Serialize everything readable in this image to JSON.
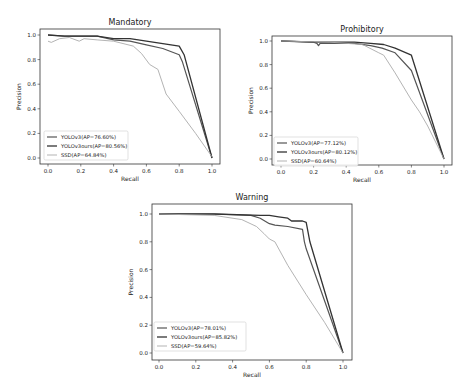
{
  "chart_data": [
    {
      "type": "line",
      "title": "Mandatory",
      "xlabel": "Recall",
      "ylabel": "Precision",
      "xlim": [
        0,
        1
      ],
      "ylim": [
        0,
        1
      ],
      "xticks": [
        "0.0",
        "0.2",
        "0.4",
        "0.6",
        "0.8",
        "1.0"
      ],
      "yticks": [
        "0.0",
        "0.2",
        "0.4",
        "0.6",
        "0.8",
        "1.0"
      ],
      "legend_position": "lower left",
      "series": [
        {
          "name": "YOLOv3(AP=76.60%)",
          "color": "#555555",
          "x": [
            0.0,
            0.1,
            0.2,
            0.3,
            0.4,
            0.5,
            0.6,
            0.7,
            0.8,
            0.82,
            1.0
          ],
          "y": [
            1.0,
            0.99,
            0.99,
            0.99,
            0.96,
            0.95,
            0.92,
            0.89,
            0.84,
            0.78,
            0.0
          ]
        },
        {
          "name": "YOLOv3ours(AP=80.56%)",
          "color": "#333333",
          "x": [
            0.0,
            0.1,
            0.2,
            0.3,
            0.4,
            0.5,
            0.6,
            0.7,
            0.8,
            0.83,
            1.0
          ],
          "y": [
            1.0,
            0.99,
            0.99,
            0.99,
            0.97,
            0.97,
            0.95,
            0.93,
            0.91,
            0.84,
            0.0
          ]
        },
        {
          "name": "SSD(AP=64.84%)",
          "color": "#aaaaaa",
          "x": [
            0.0,
            0.02,
            0.07,
            0.13,
            0.19,
            0.22,
            0.3,
            0.4,
            0.52,
            0.57,
            0.62,
            0.67,
            0.72,
            0.8,
            0.9,
            1.0
          ],
          "y": [
            0.95,
            0.94,
            0.97,
            0.98,
            0.95,
            0.97,
            0.96,
            0.95,
            0.91,
            0.85,
            0.76,
            0.72,
            0.52,
            0.38,
            0.2,
            0.01
          ]
        }
      ]
    },
    {
      "type": "line",
      "title": "Prohibitory",
      "xlabel": "Recall",
      "ylabel": "Precision",
      "xlim": [
        0,
        1
      ],
      "ylim": [
        0,
        1
      ],
      "xticks": [
        "0.0",
        "0.2",
        "0.4",
        "0.6",
        "0.8",
        "1.0"
      ],
      "yticks": [
        "0.0",
        "0.2",
        "0.4",
        "0.6",
        "0.8",
        "1.0"
      ],
      "legend_position": "lower left",
      "series": [
        {
          "name": "YOLOv3(AP=77.12%)",
          "color": "#555555",
          "x": [
            0.0,
            0.2,
            0.22,
            0.23,
            0.24,
            0.45,
            0.55,
            0.62,
            0.7,
            0.8,
            1.0
          ],
          "y": [
            1.0,
            0.99,
            0.98,
            0.96,
            0.98,
            0.98,
            0.96,
            0.94,
            0.9,
            0.75,
            0.0
          ]
        },
        {
          "name": "YOLOv3ours(AP=80.12%)",
          "color": "#333333",
          "x": [
            0.0,
            0.2,
            0.45,
            0.55,
            0.63,
            0.7,
            0.8,
            1.0
          ],
          "y": [
            1.0,
            0.99,
            0.99,
            0.98,
            0.97,
            0.94,
            0.88,
            0.0
          ]
        },
        {
          "name": "SSD(AP=60.64%)",
          "color": "#aaaaaa",
          "x": [
            0.0,
            0.3,
            0.5,
            0.6,
            0.63,
            0.7,
            0.8,
            0.85,
            0.9,
            1.0
          ],
          "y": [
            1.0,
            0.99,
            0.97,
            0.9,
            0.88,
            0.73,
            0.5,
            0.4,
            0.28,
            0.0
          ]
        }
      ]
    },
    {
      "type": "line",
      "title": "Warning",
      "xlabel": "Recall",
      "ylabel": "Precision",
      "xlim": [
        0,
        1
      ],
      "ylim": [
        0,
        1
      ],
      "xticks": [
        "0.0",
        "0.2",
        "0.4",
        "0.6",
        "0.8",
        "1.0"
      ],
      "yticks": [
        "0.0",
        "0.2",
        "0.4",
        "0.6",
        "0.8",
        "1.0"
      ],
      "legend_position": "lower left",
      "series": [
        {
          "name": "YOLOv3(AP=78.01%)",
          "color": "#555555",
          "x": [
            0.0,
            0.3,
            0.5,
            0.55,
            0.6,
            0.63,
            0.7,
            0.78,
            0.79,
            0.8,
            1.0
          ],
          "y": [
            1.0,
            1.0,
            0.99,
            0.97,
            0.93,
            0.92,
            0.91,
            0.89,
            0.8,
            0.75,
            0.0
          ]
        },
        {
          "name": "YOLOv3ours(AP=85.82%)",
          "color": "#333333",
          "x": [
            0.0,
            0.3,
            0.55,
            0.6,
            0.65,
            0.7,
            0.72,
            0.78,
            0.8,
            0.82,
            1.0
          ],
          "y": [
            1.0,
            1.0,
            0.99,
            0.99,
            0.98,
            0.97,
            0.95,
            0.95,
            0.94,
            0.8,
            0.0
          ]
        },
        {
          "name": "SSD(AP=59.64%)",
          "color": "#aaaaaa",
          "x": [
            0.0,
            0.3,
            0.45,
            0.53,
            0.57,
            0.6,
            0.63,
            0.7,
            0.8,
            0.9,
            1.0
          ],
          "y": [
            1.0,
            0.99,
            0.96,
            0.91,
            0.86,
            0.82,
            0.8,
            0.63,
            0.42,
            0.22,
            0.0
          ]
        }
      ]
    }
  ]
}
